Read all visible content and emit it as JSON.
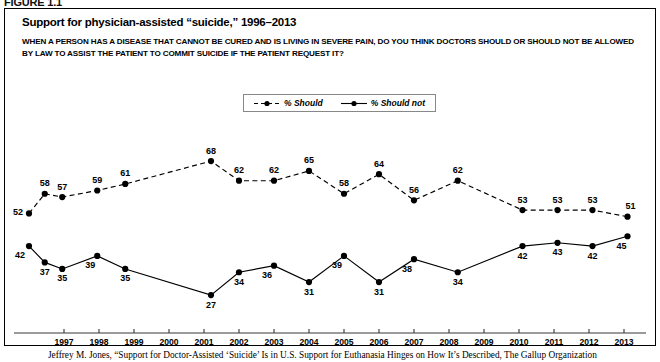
{
  "figure": {
    "label": "FIGURE 1.1",
    "title": "Support for physician-assisted “suicide,” 1996–2013",
    "subtitle": "WHEN A PERSON HAS A DISEASE THAT CANNOT BE CURED AND IS LIVING IN SEVERE PAIN, DO YOU THINK DOCTORS SHOULD OR SHOULD NOT BE ALLOWED BY LAW TO ASSIST THE PATIENT TO COMMIT SUICIDE IF THE PATIENT REQUEST IT?",
    "caption": "Jeffrey M. Jones, “Support for Doctor-Assisted ‘Suicide’ Is in U.S. Support for Euthanasia Hinges on How It’s Described, The Gallup Organization"
  },
  "legend": {
    "position": "top-center",
    "entries": [
      {
        "label": "% Should",
        "style": "dashed",
        "marker": "filled-circle",
        "color": "#000000"
      },
      {
        "label": "% Should not",
        "style": "solid",
        "marker": "filled-circle",
        "color": "#000000"
      }
    ]
  },
  "chart_data": {
    "type": "line",
    "title": "Support for physician-assisted “suicide,” 1996–2013",
    "xlabel": "",
    "ylabel": "",
    "grid": false,
    "ylim": [
      20,
      72
    ],
    "xlim": [
      1995.6,
      2013.6
    ],
    "tick_labels": [
      "1997",
      "1998",
      "1999",
      "2000",
      "2001",
      "2002",
      "2003",
      "2004",
      "2005",
      "2006",
      "2007",
      "2008",
      "2009",
      "2010",
      "2011",
      "2012",
      "2013"
    ],
    "x": [
      1996.0,
      1996.45,
      1996.95,
      1997.95,
      1998.75,
      2001.2,
      2002.0,
      2003.0,
      2004.0,
      2005.0,
      2006.0,
      2007.0,
      2008.25,
      2010.1,
      2011.1,
      2012.1,
      2013.1
    ],
    "series": [
      {
        "name": "% Should",
        "style": "dashed",
        "values": [
          52,
          58,
          57,
          59,
          61,
          68,
          62,
          62,
          65,
          58,
          64,
          56,
          62,
          53,
          53,
          53,
          51
        ]
      },
      {
        "name": "% Should not",
        "style": "solid",
        "values": [
          42,
          37,
          35,
          39,
          35,
          27,
          34,
          36,
          31,
          39,
          31,
          38,
          34,
          42,
          43,
          42,
          45
        ]
      }
    ]
  }
}
